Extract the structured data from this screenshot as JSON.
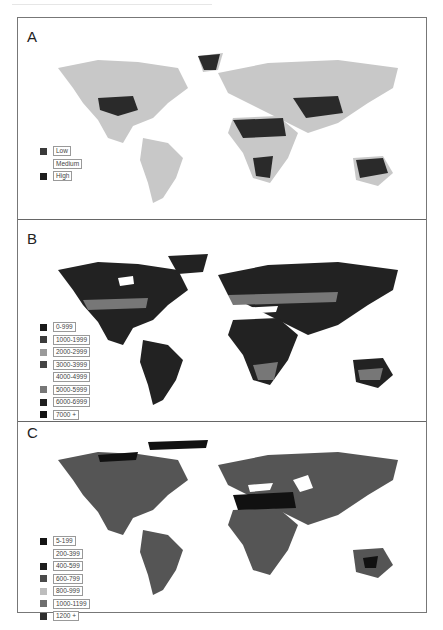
{
  "figure": {
    "panels": [
      {
        "label": "A",
        "legend": [
          {
            "label": "Low",
            "color": "#3a3a3a"
          },
          {
            "label": "Medium",
            "color": "#ffffff"
          },
          {
            "label": "High",
            "color": "#1e1e1e"
          }
        ]
      },
      {
        "label": "B",
        "legend": [
          {
            "label": "0-999",
            "color": "#1a1a1a"
          },
          {
            "label": "1000-1999",
            "color": "#3c3c3c"
          },
          {
            "label": "2000-2999",
            "color": "#9a9a9a"
          },
          {
            "label": "3000-3999",
            "color": "#444444"
          },
          {
            "label": "4000-4999",
            "color": "#ffffff"
          },
          {
            "label": "5000-5999",
            "color": "#777777"
          },
          {
            "label": "6000-6999",
            "color": "#202020"
          },
          {
            "label": "7000 +",
            "color": "#141414"
          }
        ]
      },
      {
        "label": "C",
        "legend": [
          {
            "label": "5-199",
            "color": "#141414"
          },
          {
            "label": "200-399",
            "color": "#ffffff"
          },
          {
            "label": "400-599",
            "color": "#1e1e1e"
          },
          {
            "label": "600-799",
            "color": "#4a4a4a"
          },
          {
            "label": "800-999",
            "color": "#bdbdbd"
          },
          {
            "label": "1000-1199",
            "color": "#6e6e6e"
          },
          {
            "label": "1200 +",
            "color": "#2e2e2e"
          }
        ]
      }
    ]
  }
}
